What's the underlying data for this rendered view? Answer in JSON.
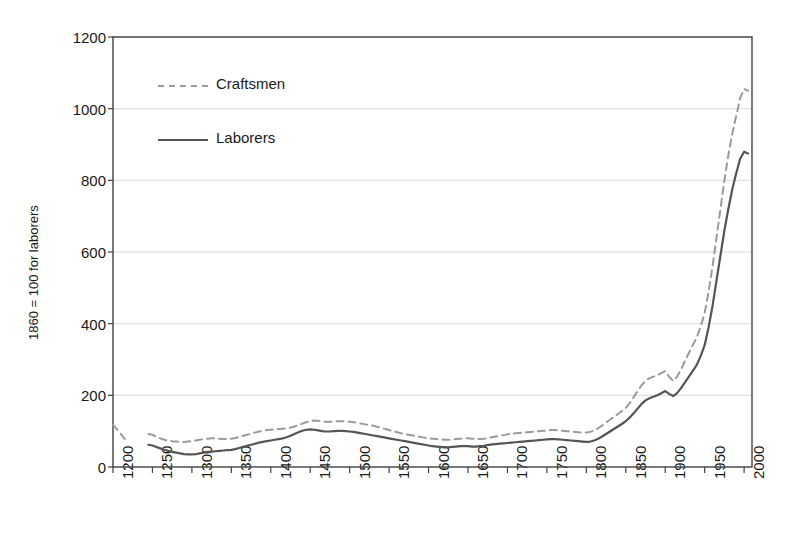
{
  "chart_data": {
    "type": "line",
    "title": "",
    "subtitle": "",
    "xlabel": "",
    "ylabel": "1860 = 100 for laborers",
    "xlim": [
      1200,
      2010
    ],
    "ylim": [
      0,
      1200
    ],
    "yticks": [
      0,
      200,
      400,
      600,
      800,
      1000,
      1200
    ],
    "xticks": [
      1200,
      1250,
      1300,
      1350,
      1400,
      1450,
      1500,
      1550,
      1600,
      1650,
      1700,
      1750,
      1800,
      1850,
      1900,
      1950,
      2000
    ],
    "grid": "horizontal",
    "legend_position": "inside-upper-left",
    "series": [
      {
        "name": "Craftsmen",
        "style": "dashed",
        "color": "#9b9b9b",
        "x": [
          1200,
          1205,
          1210,
          1215,
          1245,
          1250,
          1255,
          1260,
          1265,
          1270,
          1275,
          1280,
          1285,
          1290,
          1295,
          1300,
          1305,
          1310,
          1315,
          1320,
          1325,
          1330,
          1335,
          1340,
          1345,
          1350,
          1355,
          1360,
          1365,
          1370,
          1375,
          1380,
          1385,
          1390,
          1395,
          1400,
          1405,
          1410,
          1415,
          1420,
          1425,
          1430,
          1435,
          1440,
          1445,
          1450,
          1455,
          1460,
          1465,
          1470,
          1475,
          1480,
          1485,
          1490,
          1495,
          1500,
          1505,
          1510,
          1515,
          1520,
          1525,
          1530,
          1535,
          1540,
          1545,
          1550,
          1555,
          1560,
          1565,
          1570,
          1575,
          1580,
          1585,
          1590,
          1595,
          1600,
          1605,
          1610,
          1615,
          1620,
          1625,
          1630,
          1635,
          1640,
          1645,
          1650,
          1655,
          1660,
          1665,
          1670,
          1675,
          1680,
          1685,
          1690,
          1695,
          1700,
          1705,
          1710,
          1715,
          1720,
          1725,
          1730,
          1735,
          1740,
          1745,
          1750,
          1755,
          1760,
          1765,
          1770,
          1775,
          1780,
          1785,
          1790,
          1795,
          1800,
          1805,
          1810,
          1815,
          1820,
          1825,
          1830,
          1835,
          1840,
          1845,
          1850,
          1855,
          1860,
          1865,
          1870,
          1875,
          1880,
          1885,
          1890,
          1895,
          1900,
          1905,
          1910,
          1915,
          1920,
          1925,
          1930,
          1935,
          1940,
          1945,
          1950,
          1955,
          1960,
          1965,
          1970,
          1975,
          1980,
          1985,
          1990,
          1995,
          2000,
          2005
        ],
        "values": [
          118,
          105,
          92,
          78,
          92,
          90,
          84,
          80,
          76,
          74,
          72,
          71,
          70,
          70,
          71,
          72,
          74,
          76,
          78,
          79,
          80,
          80,
          79,
          78,
          78,
          79,
          81,
          84,
          87,
          90,
          93,
          96,
          99,
          101,
          103,
          104,
          105,
          106,
          107,
          108,
          110,
          113,
          117,
          121,
          125,
          128,
          130,
          129,
          127,
          126,
          126,
          127,
          128,
          128,
          127,
          126,
          125,
          123,
          121,
          119,
          117,
          115,
          112,
          109,
          106,
          103,
          100,
          97,
          94,
          92,
          90,
          88,
          86,
          84,
          82,
          80,
          79,
          78,
          77,
          76,
          76,
          77,
          78,
          79,
          80,
          80,
          79,
          78,
          78,
          79,
          81,
          83,
          85,
          87,
          89,
          91,
          93,
          94,
          95,
          96,
          97,
          98,
          99,
          100,
          101,
          102,
          103,
          103,
          102,
          101,
          100,
          99,
          98,
          97,
          96,
          96,
          98,
          102,
          108,
          116,
          124,
          132,
          140,
          148,
          156,
          165,
          178,
          195,
          212,
          228,
          240,
          248,
          252,
          256,
          262,
          268,
          252,
          240,
          252,
          272,
          296,
          318,
          340,
          362,
          392,
          430,
          490,
          560,
          640,
          720,
          800,
          870,
          930,
          980,
          1030,
          1055,
          1050
        ]
      },
      {
        "name": "Laborers",
        "style": "solid",
        "color": "#555555",
        "x": [
          1245,
          1250,
          1255,
          1260,
          1265,
          1270,
          1275,
          1280,
          1285,
          1290,
          1295,
          1300,
          1305,
          1310,
          1315,
          1320,
          1325,
          1330,
          1335,
          1340,
          1345,
          1350,
          1355,
          1360,
          1365,
          1370,
          1375,
          1380,
          1385,
          1390,
          1395,
          1400,
          1405,
          1410,
          1415,
          1420,
          1425,
          1430,
          1435,
          1440,
          1445,
          1450,
          1455,
          1460,
          1465,
          1470,
          1475,
          1480,
          1485,
          1490,
          1495,
          1500,
          1505,
          1510,
          1515,
          1520,
          1525,
          1530,
          1535,
          1540,
          1545,
          1550,
          1555,
          1560,
          1565,
          1570,
          1575,
          1580,
          1585,
          1590,
          1595,
          1600,
          1605,
          1610,
          1615,
          1620,
          1625,
          1630,
          1635,
          1640,
          1645,
          1650,
          1655,
          1660,
          1665,
          1670,
          1675,
          1680,
          1685,
          1690,
          1695,
          1700,
          1705,
          1710,
          1715,
          1720,
          1725,
          1730,
          1735,
          1740,
          1745,
          1750,
          1755,
          1760,
          1765,
          1770,
          1775,
          1780,
          1785,
          1790,
          1795,
          1800,
          1805,
          1810,
          1815,
          1820,
          1825,
          1830,
          1835,
          1840,
          1845,
          1850,
          1855,
          1860,
          1865,
          1870,
          1875,
          1880,
          1885,
          1890,
          1895,
          1900,
          1905,
          1910,
          1915,
          1920,
          1925,
          1930,
          1935,
          1940,
          1945,
          1950,
          1955,
          1960,
          1965,
          1970,
          1975,
          1980,
          1985,
          1990,
          1995,
          2000,
          2005
        ],
        "values": [
          62,
          60,
          56,
          52,
          48,
          45,
          42,
          40,
          38,
          36,
          35,
          35,
          36,
          38,
          40,
          42,
          43,
          44,
          45,
          46,
          47,
          48,
          50,
          53,
          56,
          59,
          62,
          65,
          68,
          70,
          72,
          74,
          76,
          78,
          80,
          83,
          87,
          92,
          97,
          101,
          104,
          105,
          104,
          102,
          100,
          99,
          99,
          100,
          101,
          101,
          100,
          99,
          98,
          96,
          94,
          92,
          90,
          88,
          86,
          84,
          82,
          80,
          78,
          76,
          74,
          72,
          70,
          68,
          66,
          64,
          62,
          60,
          58,
          57,
          56,
          55,
          55,
          56,
          57,
          58,
          58,
          58,
          57,
          57,
          58,
          59,
          61,
          63,
          64,
          65,
          66,
          67,
          68,
          69,
          70,
          71,
          72,
          73,
          74,
          75,
          76,
          77,
          78,
          78,
          77,
          76,
          75,
          74,
          73,
          72,
          71,
          70,
          71,
          74,
          79,
          85,
          92,
          99,
          106,
          113,
          120,
          128,
          138,
          150,
          163,
          176,
          186,
          192,
          196,
          200,
          206,
          212,
          204,
          198,
          206,
          220,
          236,
          252,
          268,
          285,
          310,
          340,
          390,
          450,
          520,
          590,
          660,
          720,
          775,
          820,
          860,
          880,
          875
        ]
      }
    ],
    "legend": [
      {
        "label": "Craftsmen",
        "style": "dashed",
        "color": "#9b9b9b"
      },
      {
        "label": "Laborers",
        "style": "solid",
        "color": "#555555"
      }
    ]
  },
  "colors": {
    "craftsmen": "#9b9b9b",
    "laborers": "#555555",
    "grid": "#d9d9d9",
    "axis": "#404040",
    "background": "#ffffff",
    "text": "#1a1a1a"
  }
}
